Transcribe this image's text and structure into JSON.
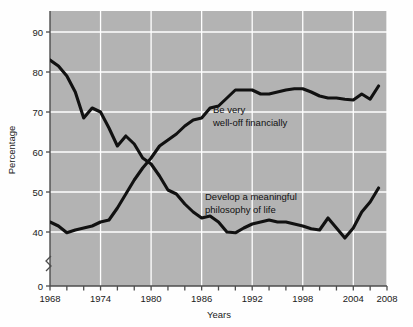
{
  "chart_data": {
    "type": "line",
    "title": "",
    "subtitle": "",
    "xlabel": "Years",
    "ylabel": "Percentage",
    "xlim": [
      1968,
      2008
    ],
    "ylim": [
      35,
      95
    ],
    "ylim_display": [
      0,
      95
    ],
    "y_axis_break": true,
    "grid": true,
    "grid_color": "#ffffff",
    "plot_background": "#b3b3b3",
    "line_color": "#111111",
    "legend_position": "inline-annotations",
    "y_ticks": [
      0,
      40,
      50,
      60,
      70,
      80,
      90
    ],
    "y_tick_labels": [
      "0",
      "40",
      "50",
      "60",
      "70",
      "80",
      "90"
    ],
    "x_ticks": [
      1968,
      1970,
      1972,
      1974,
      1976,
      1978,
      1980,
      1982,
      1984,
      1986,
      1988,
      1990,
      1992,
      1994,
      1996,
      1998,
      2000,
      2002,
      2004,
      2006,
      2008
    ],
    "x_tick_labels_shown": [
      "1968",
      "1974",
      "1980",
      "1986",
      "1992",
      "1998",
      "2004",
      "2008"
    ],
    "x_tick_labels_years": [
      1968,
      1974,
      1980,
      1986,
      1992,
      1998,
      2004,
      2008
    ],
    "annotations": [
      {
        "text_line1": "Be very",
        "text_line2": "well-off financially",
        "x": 1989,
        "y": 71
      },
      {
        "text_line1": "Develop a meaningful",
        "text_line2": "philosophy of life",
        "x": 1989,
        "y": 50
      }
    ],
    "series": [
      {
        "name": "Develop a meaningful philosophy of life",
        "x": [
          1968,
          1969,
          1970,
          1971,
          1972,
          1973,
          1974,
          1975,
          1976,
          1977,
          1978,
          1979,
          1980,
          1981,
          1982,
          1983,
          1984,
          1985,
          1986,
          1987,
          1988,
          1989,
          1990,
          1991,
          1992,
          1993,
          1994,
          1995,
          1996,
          1997,
          1998,
          1999,
          2000,
          2001,
          2002,
          2003,
          2004,
          2005,
          2006,
          2007
        ],
        "values": [
          83,
          81.5,
          79,
          75,
          68.5,
          71,
          70,
          66,
          61.5,
          64,
          62,
          58.5,
          57,
          54,
          50.5,
          49.5,
          47,
          45,
          43.5,
          44,
          42.5,
          40,
          39.8,
          41,
          42,
          42.5,
          43,
          42.5,
          42.5,
          42,
          41.5,
          40.8,
          40.5,
          43.5,
          41,
          38.5,
          41,
          45,
          47.5,
          51
        ]
      },
      {
        "name": "Be very well-off financially",
        "x": [
          1968,
          1969,
          1970,
          1971,
          1972,
          1973,
          1974,
          1975,
          1976,
          1977,
          1978,
          1979,
          1980,
          1981,
          1982,
          1983,
          1984,
          1985,
          1986,
          1987,
          1988,
          1989,
          1990,
          1991,
          1992,
          1993,
          1994,
          1995,
          1996,
          1997,
          1998,
          1999,
          2000,
          2001,
          2002,
          2003,
          2004,
          2005,
          2006,
          2007
        ],
        "values": [
          42.5,
          41.5,
          39.8,
          40.5,
          41,
          41.5,
          42.5,
          43,
          46,
          49.5,
          53,
          56,
          58.5,
          61.5,
          63,
          64.5,
          66.5,
          68,
          68.5,
          71,
          71.5,
          73.5,
          75.5,
          75.5,
          75.5,
          74.5,
          74.5,
          75,
          75.5,
          75.8,
          75.8,
          75,
          74,
          73.5,
          73.5,
          73.2,
          73,
          74.5,
          73.2,
          76.5
        ]
      }
    ]
  },
  "figure": {
    "x_axis_title": "Years",
    "y_axis_title": "Percentage"
  }
}
